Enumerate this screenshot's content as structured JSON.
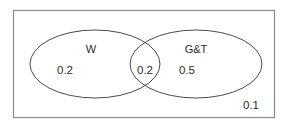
{
  "diagram": {
    "type": "venn-diagram",
    "universe": {
      "name": "universal-set-rectangle",
      "outside_value": "0.1"
    },
    "sets": [
      {
        "id": "w",
        "label": "W",
        "exclusive_value": "0.2"
      },
      {
        "id": "gt",
        "label": "G&T",
        "exclusive_value": "0.5"
      }
    ],
    "intersection": {
      "label": "W-and-GT",
      "value": "0.2"
    },
    "colors": {
      "ellipse_stroke": "#4a4a4a",
      "rect_stroke": "#8a8a8a",
      "text": "#2b2b2b",
      "background": "#ffffff"
    }
  }
}
